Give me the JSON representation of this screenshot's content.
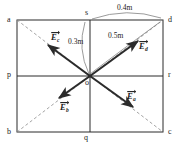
{
  "figure": {
    "type": "physics-vector-diagram"
  },
  "geometry": {
    "rect": {
      "left": 17,
      "top": 20,
      "right": 163,
      "bottom": 132
    },
    "center": {
      "x": 90,
      "y": 76,
      "label": "o"
    },
    "corners": [
      {
        "id": "a",
        "x": 17,
        "y": 20,
        "label": "a"
      },
      {
        "id": "d",
        "x": 163,
        "y": 20,
        "label": "d"
      },
      {
        "id": "b",
        "x": 17,
        "y": 132,
        "label": "b"
      },
      {
        "id": "c",
        "x": 163,
        "y": 132,
        "label": "c"
      }
    ],
    "midpoints": [
      {
        "id": "s",
        "x": 90,
        "y": 20,
        "label": "s"
      },
      {
        "id": "p",
        "x": 17,
        "y": 76,
        "label": "p"
      },
      {
        "id": "r",
        "x": 163,
        "y": 76,
        "label": "r"
      },
      {
        "id": "q",
        "x": 90,
        "y": 132,
        "label": "q"
      }
    ]
  },
  "labels": {
    "a": "a",
    "b": "b",
    "c": "c",
    "d": "d",
    "p": "p",
    "q": "q",
    "r": "r",
    "s": "s",
    "o": "o"
  },
  "dimensions": [
    {
      "id": "sd",
      "text": "0.4m",
      "from": "s",
      "to": "d"
    },
    {
      "id": "os",
      "text": "0.3m",
      "from": "o",
      "to": "s"
    },
    {
      "id": "od",
      "text": "0.5m",
      "from": "o",
      "to": "d"
    }
  ],
  "dimension_text": {
    "sd": "0.4m",
    "os": "0.3m",
    "od": "0.5m"
  },
  "vectors": [
    {
      "id": "Ec",
      "symbol": "E",
      "subscript": "c",
      "direction": "up-left",
      "toward": "a",
      "tail": {
        "x": 90,
        "y": 76
      },
      "head": {
        "x": 47,
        "y": 44
      }
    },
    {
      "id": "Ed",
      "symbol": "E",
      "subscript": "d",
      "direction": "up-right",
      "toward": "d",
      "tail": {
        "x": 90,
        "y": 76
      },
      "head": {
        "x": 139,
        "y": 40
      }
    },
    {
      "id": "Eb",
      "symbol": "E",
      "subscript": "b",
      "direction": "down-left",
      "toward": "b",
      "tail": {
        "x": 90,
        "y": 76
      },
      "head": {
        "x": 58,
        "y": 99
      }
    },
    {
      "id": "Ea",
      "symbol": "E",
      "subscript": "a",
      "direction": "down-right",
      "toward": "c",
      "tail": {
        "x": 90,
        "y": 76
      },
      "head": {
        "x": 134,
        "y": 108
      }
    }
  ],
  "vector_symbols": {
    "Ec": {
      "base": "E",
      "sub": "c"
    },
    "Ed": {
      "base": "E",
      "sub": "d"
    },
    "Eb": {
      "base": "E",
      "sub": "b"
    },
    "Ea": {
      "base": "E",
      "sub": "a"
    }
  },
  "colors": {
    "stroke": "#2b2b2b",
    "dashed": "#8c8c8c",
    "arc": "#7a7a7a",
    "text": "#1a1a1a",
    "background": "#ffffff"
  }
}
